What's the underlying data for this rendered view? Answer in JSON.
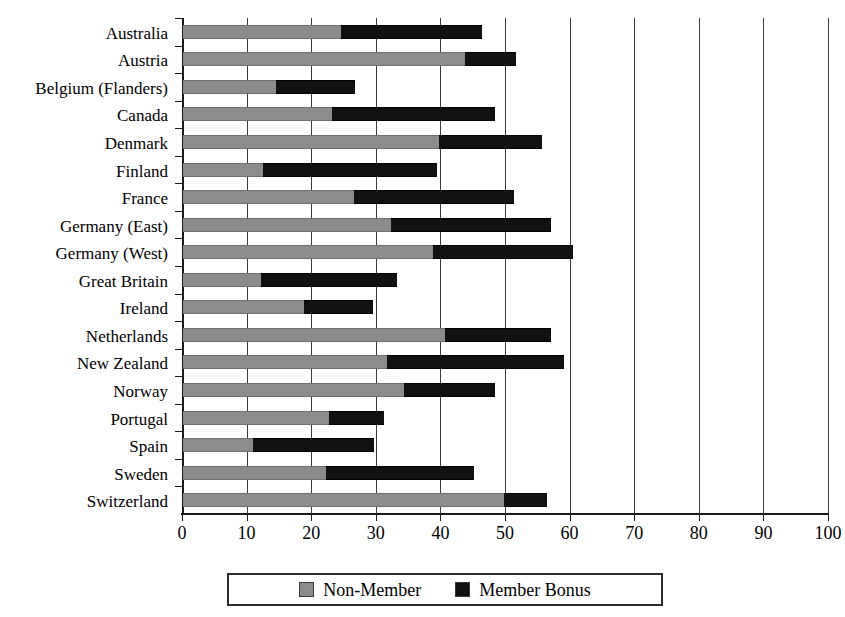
{
  "chart_data": {
    "type": "bar",
    "orientation": "horizontal",
    "stacked": true,
    "title": "",
    "subtitle": "",
    "xlabel": "",
    "ylabel": "",
    "xlim": [
      0,
      100
    ],
    "ylim": null,
    "grid": true,
    "grid_axis": "x",
    "legend_position": "bottom",
    "xticks": [
      0,
      10,
      20,
      30,
      40,
      50,
      60,
      70,
      80,
      90,
      100
    ],
    "xticklabels": [
      "0",
      "10",
      "20",
      "30",
      "40",
      "50",
      "60",
      "70",
      "80",
      "90",
      "100"
    ],
    "categories": [
      "Australia",
      "Austria",
      "Belgium (Flanders)",
      "Canada",
      "Denmark",
      "Finland",
      "France",
      "Germany (East)",
      "Germany (West)",
      "Great Britain",
      "Ireland",
      "Netherlands",
      "New Zealand",
      "Norway",
      "Portugal",
      "Spain",
      "Sweden",
      "Switzerland"
    ],
    "series": [
      {
        "name": "Non-Member",
        "color": "#8c8c8c",
        "values": [
          24.4,
          43.7,
          14.4,
          23.1,
          39.6,
          12.4,
          26.5,
          32.2,
          38.7,
          12.1,
          18.7,
          40.6,
          31.6,
          34.2,
          22.6,
          10.8,
          22.1,
          49.7
        ]
      },
      {
        "name": "Member Bonus",
        "color": "#111111",
        "values": [
          21.9,
          7.8,
          12.2,
          25.2,
          16.0,
          26.9,
          24.7,
          24.8,
          21.6,
          21.0,
          10.7,
          16.3,
          27.4,
          14.1,
          8.5,
          18.7,
          22.9,
          6.7
        ]
      }
    ],
    "totals": [
      46.3,
      51.5,
      26.6,
      48.3,
      55.6,
      39.3,
      51.2,
      57.0,
      60.3,
      33.1,
      29.4,
      56.9,
      59.0,
      48.3,
      31.1,
      29.5,
      45.0,
      56.4
    ]
  },
  "legend": {
    "items": [
      {
        "label": "Non-Member",
        "swatch": "nonmember"
      },
      {
        "label": "Member Bonus",
        "swatch": "bonus"
      }
    ]
  },
  "colors": {
    "non_member": "#8c8c8c",
    "member_bonus": "#111111",
    "axis": "#1a1a1a",
    "grid": "#3a3a3a",
    "background": "#ffffff"
  }
}
